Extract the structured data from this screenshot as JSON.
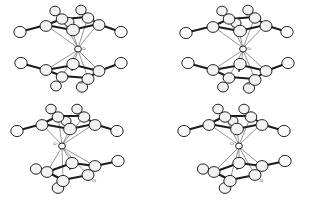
{
  "figure": {
    "background_color": "#ffffff",
    "layout": "2x2 grid",
    "panel_count": 4
  },
  "palette": {
    "background": "#ffffff",
    "bond_color": "#1c1c1c",
    "atom_fill": "#f2f2f0",
    "atom_outline": "#1a1a1a",
    "atom_shade": "#8d8d8d",
    "hapto_line": "#5a5a5a",
    "label_color": "#3a3a3a"
  },
  "structures": [
    {
      "id": "structure-top-left",
      "position": {
        "x": 0,
        "y": 0
      },
      "metal_label": "Cr",
      "ring_top_label": "C1",
      "ring_bottom_label": "C6",
      "upper_ring_atoms": 5,
      "lower_ring_atoms": 5,
      "upper_substituents": 5,
      "lower_substituents": 5,
      "orientation": "staggered sandwich, viewed near ring plane"
    },
    {
      "id": "structure-top-right",
      "position": {
        "x": 165,
        "y": 0
      },
      "metal_label": "Cr",
      "ring_top_label": "C1",
      "ring_bottom_label": "C6",
      "upper_ring_atoms": 5,
      "lower_ring_atoms": 5,
      "upper_substituents": 5,
      "lower_substituents": 5,
      "orientation": "staggered sandwich, viewed near ring plane"
    },
    {
      "id": "structure-bottom-left",
      "position": {
        "x": 0,
        "y": 100
      },
      "metal_label": "Cr",
      "ring_top_label": "C1",
      "ring_bottom_label": "C6",
      "upper_ring_atoms": 5,
      "lower_ring_atoms": 5,
      "upper_substituents": 5,
      "lower_substituents": 4,
      "orientation": "tilted sandwich, lower ring rotated"
    },
    {
      "id": "structure-bottom-right",
      "position": {
        "x": 165,
        "y": 100
      },
      "metal_label": "Cr",
      "ring_top_label": "C1",
      "ring_bottom_label": "C6",
      "upper_ring_atoms": 5,
      "lower_ring_atoms": 5,
      "upper_substituents": 5,
      "lower_substituents": 4,
      "orientation": "tilted sandwich, lower ring rotated"
    }
  ]
}
